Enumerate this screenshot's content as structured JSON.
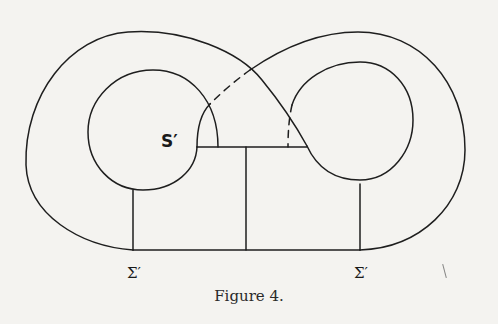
{
  "figure": {
    "caption": "Figure 4.",
    "labels": {
      "surface": "S′",
      "sigma_left": "Σ′",
      "sigma_right": "Σ′"
    },
    "colors": {
      "ink": "#1e1e1e",
      "paper": "#f4f3f0"
    },
    "elements": [
      {
        "name": "outer-left-curve",
        "style": "solid"
      },
      {
        "name": "outer-right-curve",
        "style": "solid"
      },
      {
        "name": "crossing-upper-dashed",
        "style": "dashed"
      },
      {
        "name": "crossing-lower-dashed",
        "style": "dashed"
      },
      {
        "name": "left-inner-circle",
        "style": "solid"
      },
      {
        "name": "right-inner-circle",
        "style": "solid"
      },
      {
        "name": "central-rectangle",
        "style": "solid"
      }
    ]
  }
}
